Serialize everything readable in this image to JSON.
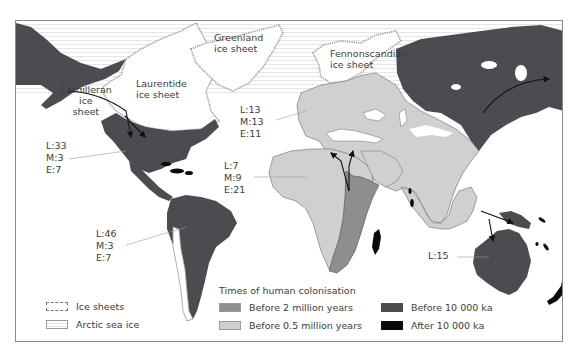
{
  "map": {
    "title": "Times of human colonisation",
    "ice_labels": {
      "cordilleran": "Cordilleran\nice\nsheet",
      "laurentide": "Laurentide\nice sheet",
      "greenland": "Greenland\nice sheet",
      "fennoscandian": "Fennonscandian\nice sheet"
    },
    "regions": {
      "north_america": {
        "L": "L:33",
        "M": "M:3",
        "E": "E:7"
      },
      "south_america": {
        "L": "L:46",
        "M": "M:3",
        "E": "E:7"
      },
      "europe": {
        "L": "L:13",
        "M": "M:13",
        "E": "E:11"
      },
      "africa": {
        "L": "L:7",
        "M": "M:9",
        "E": "E:21"
      },
      "australia": {
        "L": "L:15"
      }
    },
    "colors": {
      "before_2_million": "#8e8e8e",
      "before_0_5_million": "#d0d0d0",
      "before_10000ka": "#4c4c50",
      "after_10000ka": "#0a0a0a",
      "ice": "#ffffff",
      "sea_ice_lines": "#e2e2e2"
    }
  },
  "legend": {
    "ice_sheets": "Ice sheets",
    "arctic_sea_ice": "Arctic sea ice",
    "colonisation_title": "Times of human colonisation",
    "before_2_million": "Before 2 million years",
    "before_0_5_million": "Before 0.5 million years",
    "before_10000ka": "Before 10 000 ka",
    "after_10000ka": "After 10 000 ka"
  }
}
